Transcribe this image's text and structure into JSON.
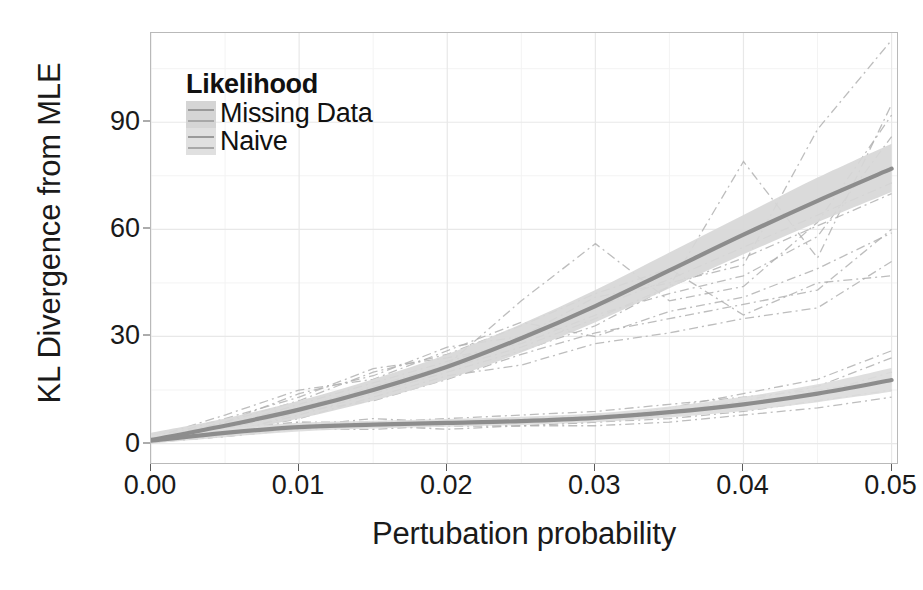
{
  "chart_data": {
    "type": "line",
    "title": "",
    "xlabel": "Pertubation probability",
    "ylabel": "KL Divergence from MLE",
    "xlim": [
      0.0,
      0.0505
    ],
    "ylim": [
      -6,
      115
    ],
    "xticks": [
      "0.00",
      "0.01",
      "0.02",
      "0.03",
      "0.04",
      "0.05"
    ],
    "xtick_values": [
      0.0,
      0.01,
      0.02,
      0.03,
      0.04,
      0.05
    ],
    "yticks": [
      "0",
      "30",
      "60",
      "90"
    ],
    "ytick_values": [
      0,
      30,
      60,
      90
    ],
    "grid": true,
    "grid_minor": true,
    "legend": {
      "title": "Likelihood",
      "position": "top-left-inside",
      "entries": [
        {
          "label": "Missing Data",
          "swatch_color": "#d5d5d5",
          "line_color": "#9a9a9a"
        },
        {
          "label": "Naive",
          "swatch_color": "#e0e0e0",
          "line_color": "#a8a8a8"
        }
      ]
    },
    "x": [
      0.0,
      0.005,
      0.01,
      0.015,
      0.02,
      0.025,
      0.03,
      0.035,
      0.04,
      0.045,
      0.05
    ],
    "series": [
      {
        "name": "Missing Data",
        "style": "smooth-trend-with-ribbon",
        "color": "#8d8d8d",
        "values": [
          1.0,
          5.0,
          9.5,
          15.0,
          21.5,
          29.5,
          38.5,
          48.5,
          58.5,
          68.0,
          77.0
        ],
        "ci_lower": [
          0.0,
          3.0,
          7.0,
          12.0,
          18.0,
          25.5,
          34.0,
          43.5,
          53.0,
          62.0,
          70.5
        ],
        "ci_upper": [
          3.0,
          7.0,
          12.0,
          18.0,
          25.0,
          33.5,
          43.0,
          53.5,
          64.0,
          74.5,
          84.0
        ]
      },
      {
        "name": "Naive",
        "style": "smooth-trend-with-ribbon",
        "color": "#8d8d8d",
        "values": [
          0.8,
          3.0,
          4.6,
          5.3,
          5.8,
          6.3,
          7.2,
          8.8,
          11.0,
          14.0,
          17.8
        ],
        "ci_lower": [
          0.0,
          1.8,
          3.4,
          4.2,
          4.7,
          5.2,
          6.0,
          7.3,
          9.1,
          11.6,
          14.5
        ],
        "ci_upper": [
          2.4,
          4.3,
          5.8,
          6.4,
          6.9,
          7.5,
          8.5,
          10.4,
          13.1,
          16.6,
          21.2
        ]
      }
    ],
    "spaghetti": {
      "style": "dot-dash",
      "color": "#b2b2b2",
      "note": "Individual replicate trajectories drawn as thin dot-dash lines for both likelihoods",
      "missing_data_runs": [
        [
          0.5,
          6,
          14,
          19,
          27,
          30,
          41,
          45,
          50,
          88,
          113
        ],
        [
          1.0,
          4,
          10,
          16,
          22,
          40,
          56,
          40,
          44,
          62,
          92
        ],
        [
          0.8,
          3,
          8,
          14,
          20,
          26,
          33,
          44,
          79,
          52,
          95
        ],
        [
          1.2,
          7,
          13,
          21,
          24,
          28,
          36,
          42,
          47,
          58,
          86
        ],
        [
          0.4,
          2,
          9,
          12,
          18,
          25,
          31,
          35,
          39,
          43,
          60
        ],
        [
          0.9,
          5,
          11,
          17,
          23,
          29,
          38,
          46,
          55,
          64,
          73
        ],
        [
          1.5,
          8,
          15,
          18,
          26,
          34,
          30,
          37,
          41,
          49,
          59
        ],
        [
          0.6,
          3,
          7,
          13,
          19,
          22,
          28,
          31,
          35,
          38,
          51
        ],
        [
          1.1,
          6,
          12,
          20,
          25,
          33,
          42,
          49,
          36,
          45,
          47
        ],
        [
          0.7,
          4,
          9,
          15,
          21,
          27,
          35,
          44,
          52,
          61,
          70
        ]
      ],
      "naive_runs": [
        [
          0.5,
          3,
          5,
          6,
          5,
          5,
          6,
          8,
          11,
          14,
          20
        ],
        [
          1.0,
          4,
          6,
          5,
          6,
          7,
          8,
          9,
          12,
          16,
          24
        ],
        [
          0.3,
          2,
          4,
          4,
          5,
          5,
          6,
          7,
          9,
          12,
          15
        ],
        [
          0.8,
          3,
          5,
          7,
          6,
          6,
          7,
          10,
          14,
          18,
          26
        ],
        [
          0.6,
          2,
          4,
          5,
          4,
          5,
          5,
          6,
          8,
          10,
          13
        ],
        [
          1.2,
          4,
          6,
          6,
          7,
          8,
          9,
          11,
          13,
          15,
          18
        ]
      ]
    }
  }
}
